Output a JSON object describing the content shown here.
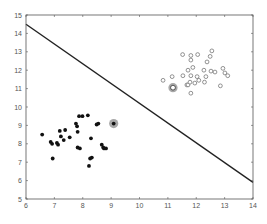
{
  "chart_data": {
    "type": "scatter",
    "title": "",
    "xlabel": "",
    "ylabel": "",
    "xlim": [
      6,
      14
    ],
    "ylim": [
      5,
      15
    ],
    "grid": false,
    "legend": null,
    "x_ticks": [
      "6",
      "7",
      "8",
      "9",
      "10",
      "11",
      "12",
      "13",
      "14"
    ],
    "y_ticks": [
      "5",
      "6",
      "7",
      "8",
      "9",
      "10",
      "11",
      "12",
      "13",
      "14",
      "15"
    ],
    "series": [
      {
        "name": "class-1-filled",
        "marker": "filled-dot",
        "color": "#111111",
        "points": [
          [
            6.57,
            8.5
          ],
          [
            6.87,
            8.1
          ],
          [
            6.92,
            8.0
          ],
          [
            7.09,
            8.05
          ],
          [
            7.13,
            7.95
          ],
          [
            7.19,
            8.7
          ],
          [
            7.23,
            8.4
          ],
          [
            7.33,
            8.2
          ],
          [
            7.38,
            8.75
          ],
          [
            7.54,
            8.35
          ],
          [
            6.94,
            7.2
          ],
          [
            7.76,
            9.1
          ],
          [
            7.8,
            8.95
          ],
          [
            7.82,
            8.65
          ],
          [
            7.87,
            9.5
          ],
          [
            7.99,
            9.5
          ],
          [
            8.18,
            9.55
          ],
          [
            7.82,
            7.8
          ],
          [
            7.9,
            7.75
          ],
          [
            8.29,
            8.3
          ],
          [
            8.49,
            9.05
          ],
          [
            8.55,
            9.1
          ],
          [
            8.67,
            7.95
          ],
          [
            8.72,
            7.8
          ],
          [
            8.75,
            7.75
          ],
          [
            8.82,
            7.75
          ],
          [
            8.32,
            7.25
          ],
          [
            8.26,
            7.2
          ],
          [
            8.22,
            6.8
          ]
        ]
      },
      {
        "name": "class-2-open",
        "marker": "open-circle",
        "color": "#666666",
        "points": [
          [
            10.83,
            11.45
          ],
          [
            11.15,
            11.65
          ],
          [
            11.53,
            11.7
          ],
          [
            11.52,
            12.85
          ],
          [
            11.67,
            11.2
          ],
          [
            11.71,
            11.2
          ],
          [
            11.71,
            12.0
          ],
          [
            11.78,
            11.35
          ],
          [
            11.81,
            12.8
          ],
          [
            11.81,
            12.55
          ],
          [
            11.81,
            11.7
          ],
          [
            11.88,
            12.15
          ],
          [
            11.81,
            10.75
          ],
          [
            11.95,
            11.3
          ],
          [
            12.03,
            11.65
          ],
          [
            12.05,
            12.85
          ],
          [
            12.09,
            11.45
          ],
          [
            12.27,
            12.0
          ],
          [
            12.29,
            11.35
          ],
          [
            12.34,
            11.65
          ],
          [
            12.38,
            12.45
          ],
          [
            12.49,
            12.75
          ],
          [
            12.52,
            11.95
          ],
          [
            12.66,
            11.9
          ],
          [
            12.55,
            13.05
          ],
          [
            12.85,
            11.15
          ],
          [
            12.94,
            12.1
          ],
          [
            13.01,
            11.85
          ],
          [
            13.11,
            11.7
          ]
        ]
      },
      {
        "name": "highlighted-filled",
        "marker": "filled-dot-halo",
        "color": "#111111",
        "halo_color": "#999999",
        "points": [
          [
            9.09,
            9.1
          ]
        ]
      },
      {
        "name": "highlighted-open",
        "marker": "open-circle-halo",
        "color": "#333333",
        "halo_color": "#999999",
        "points": [
          [
            11.18,
            11.05
          ]
        ]
      }
    ],
    "lines": [
      {
        "name": "decision-boundary",
        "color": "#222222",
        "x": [
          6,
          14
        ],
        "y": [
          14.5,
          5.9
        ]
      }
    ]
  }
}
